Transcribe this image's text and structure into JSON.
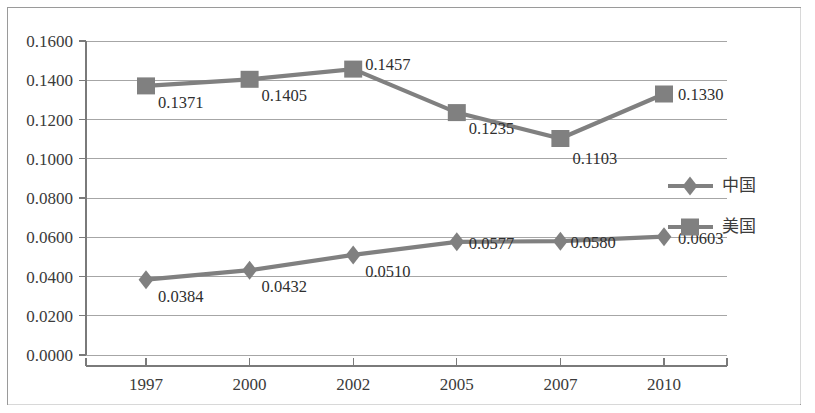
{
  "chart_data": {
    "type": "line",
    "title": "",
    "subtitle": "",
    "xlabel": "",
    "ylabel": "",
    "categories": [
      "1997",
      "2000",
      "2002",
      "2005",
      "2007",
      "2010"
    ],
    "series": [
      {
        "name": "中国",
        "marker": "diamond",
        "color": "#808080",
        "values": [
          0.0384,
          0.0432,
          0.051,
          0.0577,
          0.058,
          0.0603
        ],
        "labels": [
          "0.0384",
          "0.0432",
          "0.0510",
          "0.0577",
          "0.0580",
          "0.0603"
        ]
      },
      {
        "name": "美国",
        "marker": "square",
        "color": "#808080",
        "values": [
          0.1371,
          0.1405,
          0.1457,
          0.1235,
          0.1103,
          0.133
        ],
        "labels": [
          "0.1371",
          "0.1405",
          "0.1457",
          "0.1235",
          "0.1103",
          "0.1330"
        ]
      }
    ],
    "ylim": [
      0.0,
      0.16
    ],
    "ytick_step": 0.02,
    "ytick_labels": [
      "0.0000",
      "0.0200",
      "0.0400",
      "0.0600",
      "0.0800",
      "0.1000",
      "0.1200",
      "0.1400",
      "0.1600"
    ],
    "grid": true,
    "grid_axis": "y",
    "legend_position": "right-middle"
  },
  "legend": {
    "entries": [
      {
        "label": "中国",
        "marker": "diamond"
      },
      {
        "label": "美国",
        "marker": "square"
      }
    ]
  },
  "colors": {
    "series_gray": "#808080",
    "gridline": "#a6a6a6",
    "axis": "#7a7a7a",
    "text": "#3b3b3b",
    "frame": "#9a9a9a",
    "background": "#ffffff"
  }
}
